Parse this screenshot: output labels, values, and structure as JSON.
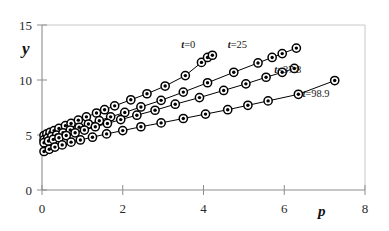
{
  "chart_data": {
    "type": "scatter",
    "title": "",
    "subtitle": "",
    "xlabel": "p",
    "ylabel": "y",
    "xlim": [
      0,
      8
    ],
    "ylim": [
      0,
      15
    ],
    "xticks": [
      0,
      2,
      4,
      6,
      8
    ],
    "yticks": [
      0,
      5,
      10,
      15
    ],
    "xtick_labels": [
      "0",
      "2",
      "4",
      "6",
      "8"
    ],
    "ytick_labels": [
      "0",
      "5",
      "10",
      "15"
    ],
    "grid": false,
    "legend_position": "inline-annotations",
    "marker": "circle-with-center-dot",
    "line_style": "solid-connected",
    "series": [
      {
        "name": "t=0",
        "label": "t=0",
        "label_prefix": "t",
        "label_value": "=0",
        "annotation_x": 3.45,
        "annotation_y": 12.9,
        "color": "#000000",
        "points": [
          {
            "x": 0.05,
            "y": 4.95
          },
          {
            "x": 0.12,
            "y": 5.1
          },
          {
            "x": 0.2,
            "y": 5.25
          },
          {
            "x": 0.3,
            "y": 5.4
          },
          {
            "x": 0.42,
            "y": 5.6
          },
          {
            "x": 0.58,
            "y": 5.85
          },
          {
            "x": 0.72,
            "y": 6.05
          },
          {
            "x": 0.9,
            "y": 6.35
          },
          {
            "x": 1.1,
            "y": 6.65
          },
          {
            "x": 1.35,
            "y": 7.0
          },
          {
            "x": 1.55,
            "y": 7.3
          },
          {
            "x": 1.8,
            "y": 7.65
          },
          {
            "x": 2.2,
            "y": 8.2
          },
          {
            "x": 2.6,
            "y": 8.75
          },
          {
            "x": 3.05,
            "y": 9.45
          },
          {
            "x": 3.55,
            "y": 10.4
          },
          {
            "x": 3.95,
            "y": 11.6
          },
          {
            "x": 4.1,
            "y": 12.05
          },
          {
            "x": 4.22,
            "y": 12.25
          }
        ]
      },
      {
        "name": "t=25",
        "label": "t=25",
        "label_prefix": "t",
        "label_value": "=25",
        "annotation_x": 4.6,
        "annotation_y": 12.9,
        "color": "#000000",
        "points": [
          {
            "x": 0.05,
            "y": 4.55
          },
          {
            "x": 0.14,
            "y": 4.7
          },
          {
            "x": 0.24,
            "y": 4.85
          },
          {
            "x": 0.36,
            "y": 5.0
          },
          {
            "x": 0.52,
            "y": 5.2
          },
          {
            "x": 0.7,
            "y": 5.45
          },
          {
            "x": 0.92,
            "y": 5.7
          },
          {
            "x": 1.15,
            "y": 6.0
          },
          {
            "x": 1.42,
            "y": 6.3
          },
          {
            "x": 1.7,
            "y": 6.65
          },
          {
            "x": 2.05,
            "y": 7.05
          },
          {
            "x": 2.45,
            "y": 7.55
          },
          {
            "x": 2.95,
            "y": 8.15
          },
          {
            "x": 3.5,
            "y": 8.9
          },
          {
            "x": 4.1,
            "y": 9.75
          },
          {
            "x": 4.75,
            "y": 10.7
          },
          {
            "x": 5.35,
            "y": 11.55
          },
          {
            "x": 5.7,
            "y": 12.05
          },
          {
            "x": 5.95,
            "y": 12.4
          },
          {
            "x": 6.3,
            "y": 12.9
          }
        ]
      },
      {
        "name": "t=37.8",
        "label": "t=37.8",
        "label_prefix": "t",
        "label_value": "=37.8",
        "annotation_x": 5.75,
        "annotation_y": 10.6,
        "color": "#000000",
        "points": [
          {
            "x": 0.05,
            "y": 4.3
          },
          {
            "x": 0.16,
            "y": 4.45
          },
          {
            "x": 0.28,
            "y": 4.6
          },
          {
            "x": 0.42,
            "y": 4.75
          },
          {
            "x": 0.6,
            "y": 4.95
          },
          {
            "x": 0.82,
            "y": 5.2
          },
          {
            "x": 1.05,
            "y": 5.45
          },
          {
            "x": 1.32,
            "y": 5.75
          },
          {
            "x": 1.62,
            "y": 6.05
          },
          {
            "x": 1.95,
            "y": 6.4
          },
          {
            "x": 2.35,
            "y": 6.8
          },
          {
            "x": 2.8,
            "y": 7.25
          },
          {
            "x": 3.3,
            "y": 7.8
          },
          {
            "x": 3.9,
            "y": 8.4
          },
          {
            "x": 4.5,
            "y": 9.05
          },
          {
            "x": 5.05,
            "y": 9.65
          },
          {
            "x": 5.55,
            "y": 10.25
          },
          {
            "x": 5.95,
            "y": 10.7
          },
          {
            "x": 6.25,
            "y": 11.05
          }
        ]
      },
      {
        "name": "t=98.9",
        "label": "t=98.9",
        "label_prefix": "t",
        "label_value": "=98.9",
        "annotation_x": 6.45,
        "annotation_y": 8.45,
        "color": "#000000",
        "points": [
          {
            "x": 0.05,
            "y": 3.5
          },
          {
            "x": 0.18,
            "y": 3.7
          },
          {
            "x": 0.32,
            "y": 3.9
          },
          {
            "x": 0.5,
            "y": 4.1
          },
          {
            "x": 0.72,
            "y": 4.35
          },
          {
            "x": 0.95,
            "y": 4.55
          },
          {
            "x": 1.25,
            "y": 4.8
          },
          {
            "x": 1.6,
            "y": 5.1
          },
          {
            "x": 2.0,
            "y": 5.4
          },
          {
            "x": 2.45,
            "y": 5.75
          },
          {
            "x": 2.95,
            "y": 6.1
          },
          {
            "x": 3.5,
            "y": 6.5
          },
          {
            "x": 4.05,
            "y": 6.9
          },
          {
            "x": 4.6,
            "y": 7.3
          },
          {
            "x": 5.1,
            "y": 7.7
          },
          {
            "x": 5.6,
            "y": 8.1
          },
          {
            "x": 6.35,
            "y": 8.7
          },
          {
            "x": 7.25,
            "y": 9.95
          }
        ]
      }
    ]
  },
  "axes": {
    "y_axis_title": "y",
    "x_axis_title": "p"
  }
}
